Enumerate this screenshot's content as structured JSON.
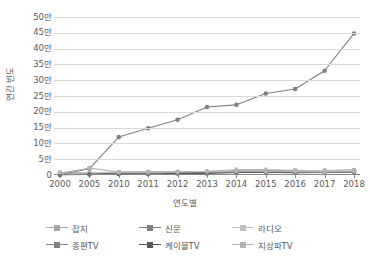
{
  "chart_data": {
    "type": "line",
    "title": "",
    "xlabel": "연도별",
    "ylabel": "연간 빈도",
    "categories": [
      "2000",
      "2005",
      "2010",
      "2011",
      "2012",
      "2013",
      "2014",
      "2015",
      "2016",
      "2017",
      "2018"
    ],
    "ytick_labels": [
      "0",
      "5만",
      "10만",
      "15만",
      "20만",
      "25만",
      "30만",
      "35만",
      "40만",
      "45만",
      "50만"
    ],
    "ytick_values": [
      0,
      50000,
      100000,
      150000,
      200000,
      250000,
      300000,
      350000,
      400000,
      450000,
      500000
    ],
    "ylim": [
      0,
      500000
    ],
    "grid": true,
    "legend_position": "bottom",
    "series": [
      {
        "name": "잡지",
        "color": "#a6a6a6",
        "values": [
          8000,
          6000,
          8000,
          9000,
          9000,
          9000,
          10000,
          10000,
          10000,
          10000,
          12000
        ]
      },
      {
        "name": "신문",
        "color": "#808080",
        "values": [
          3000,
          4000,
          5000,
          6000,
          8000,
          9000,
          13000,
          13000,
          14000,
          14000,
          16000
        ]
      },
      {
        "name": "라디오",
        "color": "#bfbfbf",
        "values": [
          5000,
          7000,
          9000,
          9000,
          10000,
          12000,
          17000,
          17000,
          15000,
          14000,
          15000
        ]
      },
      {
        "name": "종편TV",
        "color": "#808080",
        "values": [
          1000,
          20000,
          120000,
          148000,
          175000,
          215000,
          222000,
          258000,
          272000,
          330000,
          448000
        ]
      },
      {
        "name": "케이블TV",
        "color": "#595959",
        "values": [
          1000,
          1500,
          3000,
          3000,
          5000,
          5000,
          8000,
          9000,
          7000,
          8000,
          9000
        ]
      },
      {
        "name": "지상파TV",
        "color": "#b3b3b3",
        "values": [
          6000,
          22000,
          9000,
          10000,
          10000,
          11000,
          12000,
          11000,
          11000,
          10000,
          11000
        ]
      }
    ]
  },
  "legend": {
    "items": [
      {
        "label": "잡지",
        "color": "#a6a6a6"
      },
      {
        "label": "신문",
        "color": "#808080"
      },
      {
        "label": "라디오",
        "color": "#bfbfbf"
      },
      {
        "label": "종편TV",
        "color": "#808080"
      },
      {
        "label": "케이블TV",
        "color": "#595959"
      },
      {
        "label": "지상파TV",
        "color": "#b3b3b3"
      }
    ]
  },
  "colors": {
    "gridline": "#d9d9d9",
    "axis": "#868686",
    "text": "#595959",
    "background": "#ffffff"
  }
}
